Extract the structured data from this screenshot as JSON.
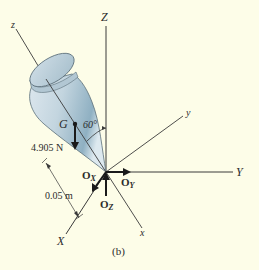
{
  "figure": {
    "caption": "(b)",
    "background_color": "#fdfde8",
    "axes": {
      "global": {
        "X": "X",
        "Y": "Y",
        "Z": "Z"
      },
      "local": {
        "x": "x",
        "y": "y",
        "z": "z"
      }
    },
    "points": {
      "G": "G"
    },
    "angle_label": "60°",
    "weight_label": "4.905 N",
    "dimension_label": "0.05 m",
    "reactions": {
      "Ox": {
        "main": "O",
        "sub": "X"
      },
      "Oy": {
        "main": "O",
        "sub": "Y"
      },
      "Oz": {
        "main": "O",
        "sub": "Z"
      }
    },
    "colors": {
      "line": "#3a3a3a",
      "body_light": "#e6eef3",
      "body_mid": "#b9cdd8",
      "body_dark": "#8eaabb"
    }
  }
}
